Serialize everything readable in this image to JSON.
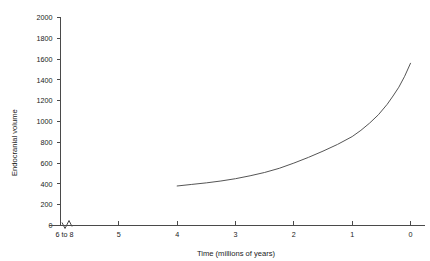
{
  "chart_data": {
    "type": "line",
    "title": "",
    "xlabel": "Time (millions of years)",
    "ylabel": "Endocranial volume",
    "x_tick_labels": [
      "6 to 8",
      "5",
      "4",
      "3",
      "2",
      "1",
      "0"
    ],
    "x_tick_values": [
      6,
      5,
      4,
      3,
      2,
      1,
      0
    ],
    "y_tick_labels": [
      "0",
      "200",
      "400",
      "600",
      "800",
      "1000",
      "1200",
      "1400",
      "1600",
      "1800",
      "2000"
    ],
    "y_tick_values": [
      0,
      200,
      400,
      600,
      800,
      1000,
      1200,
      1400,
      1600,
      1800,
      2000
    ],
    "xlim": [
      6,
      0
    ],
    "ylim": [
      0,
      2000
    ],
    "x_axis_reversed": true,
    "x_axis_break": true,
    "grid": false,
    "legend": false,
    "series": [
      {
        "name": "Endocranial volume",
        "x": [
          4.0,
          3.75,
          3.5,
          3.25,
          3.0,
          2.75,
          2.5,
          2.25,
          2.0,
          1.75,
          1.5,
          1.25,
          1.0,
          0.85,
          0.7,
          0.55,
          0.4,
          0.3,
          0.2,
          0.1,
          0.0
        ],
        "values": [
          380,
          395,
          410,
          428,
          450,
          478,
          510,
          550,
          600,
          655,
          715,
          780,
          855,
          915,
          985,
          1065,
          1165,
          1245,
          1330,
          1435,
          1560
        ]
      }
    ]
  },
  "axis_colors": {
    "line": "#4a4a4a",
    "curve": "#555555",
    "text": "#1a1a1a",
    "background": "#ffffff"
  }
}
